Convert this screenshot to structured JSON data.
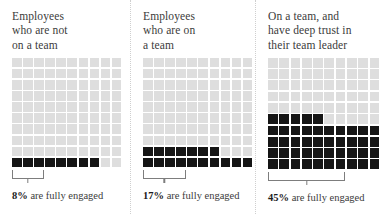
{
  "chart_data": {
    "type": "bar",
    "xlabel": "",
    "ylabel": "Percent fully engaged",
    "unit": "percent",
    "grid_total": 100,
    "grid_columns": 10,
    "grid_rows": 10,
    "categories": [
      "Employees who are not on a team",
      "Employees who are on a team",
      "On a team, and have deep trust in their team leader"
    ],
    "values": [
      8,
      17,
      45
    ],
    "ylim": [
      0,
      100
    ],
    "legend": ""
  },
  "colors": {
    "filled_square": "#151515",
    "empty_square": "#dedede",
    "bracket": "#7d7d7d",
    "divider": "#cfcfcf",
    "text": "#3b3b3b",
    "background": "#ffffff"
  },
  "panels": [
    {
      "title": "Employees\nwho are not\non a team",
      "percent_label": "8",
      "percent_symbol": "%",
      "caption_rest": " are fully engaged",
      "filled": 8,
      "bracket_columns": 3
    },
    {
      "title": "Employees\nwho are on\na team",
      "percent_label": "17",
      "percent_symbol": "%",
      "caption_rest": " are fully engaged",
      "filled": 17,
      "bracket_columns": 4
    },
    {
      "title": "On a team, and\nhave deep trust in\ntheir team leader",
      "percent_label": "45",
      "percent_symbol": "%",
      "caption_rest": " are fully engaged",
      "filled": 45,
      "bracket_columns": 7
    }
  ]
}
